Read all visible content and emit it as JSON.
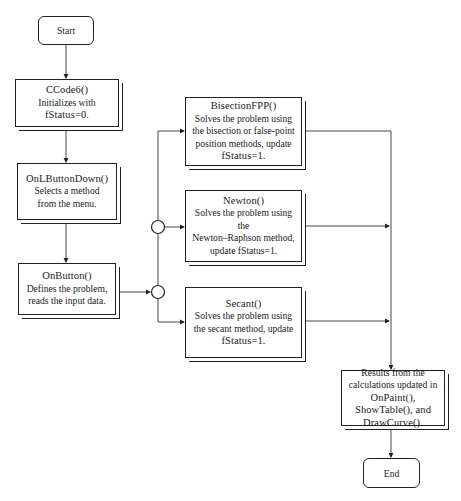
{
  "diagram": {
    "type": "flowchart",
    "nodes": {
      "start": {
        "label": "Start"
      },
      "ccode6": {
        "title": "CCode6()",
        "lines": [
          "Initializes with",
          "fStatus=0."
        ]
      },
      "onlbuttondown": {
        "title": "OnLButtonDown()",
        "lines": [
          "Selects a method",
          "from the menu."
        ]
      },
      "onbutton": {
        "title": "OnButton()",
        "lines": [
          "Defines the problem,",
          "reads the input data."
        ]
      },
      "bisection": {
        "title": "BisectionFPP()",
        "lines": [
          "Solves the problem using",
          "the bisection or false-point",
          "position methods, update",
          "fStatus=1."
        ]
      },
      "newton": {
        "title": "Newton()",
        "lines": [
          "Solves the problem using the",
          "Newton–Raphson method,",
          "update fStatus=1."
        ]
      },
      "secant": {
        "title": "Secant()",
        "lines": [
          "Solves the problem using",
          "the secant method, update",
          "fStatus=1."
        ]
      },
      "results": {
        "lines": [
          "Results from the",
          "calculations updated in",
          "OnPaint(),",
          "ShowTable(), and",
          "DrawCurve()."
        ]
      },
      "end": {
        "label": "End"
      }
    },
    "edges": [
      [
        "start",
        "ccode6"
      ],
      [
        "ccode6",
        "onlbuttondown"
      ],
      [
        "onlbuttondown",
        "onbutton"
      ],
      [
        "onbutton",
        "junction"
      ],
      [
        "junction",
        "bisection"
      ],
      [
        "junction",
        "newton"
      ],
      [
        "junction",
        "secant"
      ],
      [
        "bisection",
        "results"
      ],
      [
        "newton",
        "results"
      ],
      [
        "secant",
        "results"
      ],
      [
        "results",
        "end"
      ]
    ]
  }
}
